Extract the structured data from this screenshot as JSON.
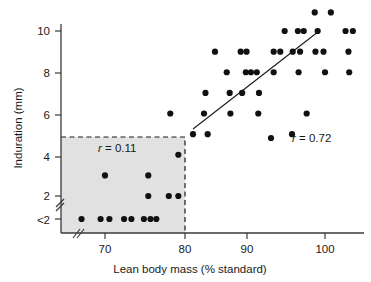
{
  "chart_data": {
    "type": "scatter",
    "title": "",
    "xlabel": "Lean body mass (% standard)",
    "ylabel": "Induration (mm)",
    "xlim": [
      63,
      105.5
    ],
    "ylim": [
      0.6,
      10.9
    ],
    "xticks": [
      70,
      80,
      90,
      100
    ],
    "xtick_labels": [
      "70",
      "80",
      "90",
      "100"
    ],
    "yticks": [
      10,
      8,
      6,
      4,
      2,
      1
    ],
    "ytick_labels": [
      "10",
      "8",
      "6",
      "4",
      "2",
      "<2"
    ],
    "grid": false,
    "legend_position": "none",
    "axis_breaks": {
      "x_break_near_origin": true,
      "y_break_between": [
        "2",
        "<2"
      ]
    },
    "annotations": [
      {
        "name": "r-low-group",
        "text": "r = 0.11",
        "x": 72.5,
        "y": 4.55,
        "italic_symbol": "r"
      },
      {
        "name": "r-high-group",
        "text": "r = 0.72",
        "x": 96.5,
        "y": 4.6,
        "italic_symbol": "r",
        "marker": true
      }
    ],
    "shaded_region": {
      "label": "low lean body mass subgroup",
      "x_range": [
        63,
        80.3
      ],
      "y_range": [
        0.6,
        5.0
      ],
      "fill": "#dcdcdc",
      "border": "dashed"
    },
    "trend_line": {
      "label": "regression line (high group)",
      "x_start": 82.0,
      "y_start": 5.25,
      "x_end": 99.2,
      "y_end": 10.0
    },
    "series": [
      {
        "name": "low lean body mass (shaded, r = 0.11)",
        "points": [
          [
            66.8,
            1.0
          ],
          [
            69.4,
            1.0
          ],
          [
            70.6,
            1.0
          ],
          [
            72.6,
            1.0
          ],
          [
            73.6,
            1.0
          ],
          [
            75.3,
            1.0
          ],
          [
            76.2,
            1.0
          ],
          [
            77.0,
            1.0
          ],
          [
            70.0,
            3.0
          ],
          [
            75.9,
            3.0
          ],
          [
            75.9,
            2.0
          ],
          [
            78.7,
            2.0
          ],
          [
            80.0,
            2.0
          ],
          [
            80.0,
            4.0
          ]
        ]
      },
      {
        "name": "high lean body mass (r = 0.72)",
        "points": [
          [
            78.9,
            6.0
          ],
          [
            82.0,
            5.0
          ],
          [
            84.0,
            5.0
          ],
          [
            83.5,
            6.0
          ],
          [
            83.7,
            7.0
          ],
          [
            85.0,
            9.0
          ],
          [
            86.6,
            8.0
          ],
          [
            87.0,
            7.0
          ],
          [
            87.1,
            6.0
          ],
          [
            88.7,
            7.0
          ],
          [
            89.2,
            8.0
          ],
          [
            89.9,
            8.0
          ],
          [
            90.7,
            8.0
          ],
          [
            90.9,
            6.0
          ],
          [
            91.0,
            7.0
          ],
          [
            88.5,
            9.0
          ],
          [
            89.3,
            9.0
          ],
          [
            93.0,
            8.0
          ],
          [
            93.0,
            9.0
          ],
          [
            93.9,
            9.0
          ],
          [
            94.5,
            10.0
          ],
          [
            95.6,
            9.0
          ],
          [
            96.6,
            9.0
          ],
          [
            96.3,
            10.0
          ],
          [
            97.1,
            10.0
          ],
          [
            96.4,
            8.0
          ],
          [
            97.5,
            6.0
          ],
          [
            98.6,
            10.9
          ],
          [
            100.8,
            10.9
          ],
          [
            99.0,
            10.0
          ],
          [
            98.7,
            9.0
          ],
          [
            99.8,
            9.0
          ],
          [
            100.0,
            8.0
          ],
          [
            102.8,
            10.0
          ],
          [
            103.8,
            10.0
          ],
          [
            103.2,
            9.0
          ],
          [
            103.3,
            8.0
          ],
          [
            95.5,
            5.0
          ]
        ]
      }
    ]
  },
  "figure": {
    "alt": "Scatter plot of induration versus lean body mass showing two correlation subgroups"
  }
}
